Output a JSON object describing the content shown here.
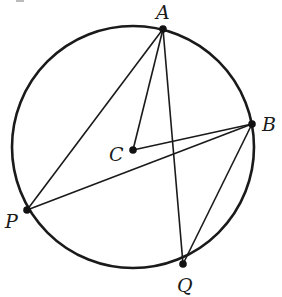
{
  "diagram": {
    "type": "circle-geometry",
    "circle": {
      "center": "C",
      "cx": 133,
      "cy": 147,
      "r": 121
    },
    "points": [
      {
        "name": "A",
        "label": "A",
        "x": 163,
        "y": 29,
        "label_x": 156,
        "label_y": 19
      },
      {
        "name": "B",
        "label": "B",
        "x": 252,
        "y": 124,
        "label_x": 262,
        "label_y": 131
      },
      {
        "name": "C",
        "label": "C",
        "x": 133,
        "y": 150,
        "label_x": 109,
        "label_y": 161
      },
      {
        "name": "P",
        "label": "P",
        "x": 27,
        "y": 210,
        "label_x": 5,
        "label_y": 228
      },
      {
        "name": "Q",
        "label": "Q",
        "x": 183,
        "y": 264,
        "label_x": 177,
        "label_y": 292
      }
    ],
    "segments": [
      {
        "from": "A",
        "to": "P"
      },
      {
        "from": "A",
        "to": "C"
      },
      {
        "from": "A",
        "to": "Q"
      },
      {
        "from": "C",
        "to": "B"
      },
      {
        "from": "P",
        "to": "B"
      },
      {
        "from": "B",
        "to": "Q"
      }
    ]
  }
}
